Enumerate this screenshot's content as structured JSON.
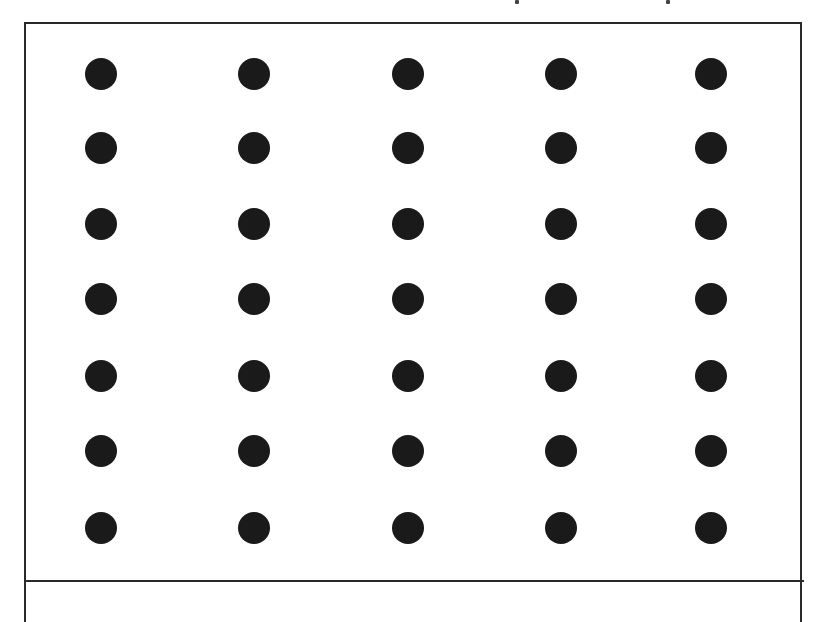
{
  "figure": {
    "columns": 5,
    "rows": 7,
    "dot_color": "#1a1a1a",
    "border_color": "#2a2a2a",
    "column_x": [
      101,
      254,
      408,
      561,
      711
    ],
    "row_y": [
      74,
      148,
      224,
      299,
      376,
      451,
      528
    ],
    "dot_diameter": 32
  }
}
